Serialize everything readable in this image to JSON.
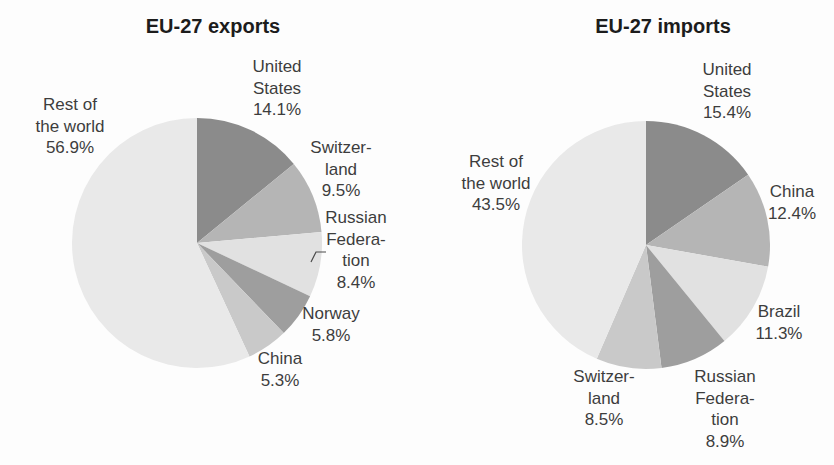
{
  "figure": {
    "background": "#fdfdfd",
    "label_text_color": "#3d3d3d",
    "title_text_color": "#1c1c1c",
    "callout_line_color": "#4a4a4a"
  },
  "chart_data": [
    {
      "type": "pie",
      "id": "eu27-exports",
      "title": "EU-27 exports",
      "unit": "%",
      "direction": "clockwise",
      "start_angle_deg": 0,
      "center_x": 197,
      "center_y": 243,
      "radius": 125,
      "slices": [
        {
          "name": "United States",
          "value": 14.1,
          "color": "#8b8b8b",
          "label_lines": [
            "United",
            "States",
            "14.1%"
          ],
          "label_x": 277,
          "label_y": 59
        },
        {
          "name": "Switzerland",
          "value": 9.5,
          "color": "#b5b5b5",
          "label_lines": [
            "Switzer-",
            "land",
            "9.5%"
          ],
          "label_x": 341,
          "label_y": 140
        },
        {
          "name": "Russian Federation",
          "value": 8.4,
          "color": "#e1e1e1",
          "label_lines": [
            "Russian",
            "Federa-",
            "tion",
            "8.4%"
          ],
          "label_x": 356,
          "label_y": 210,
          "callout": [
            [
              311,
              262
            ],
            [
              316,
              252
            ],
            [
              326,
              252
            ]
          ]
        },
        {
          "name": "Norway",
          "value": 5.8,
          "color": "#9e9e9e",
          "label_lines": [
            "Norway",
            "5.8%"
          ],
          "label_x": 331,
          "label_y": 306
        },
        {
          "name": "China",
          "value": 5.3,
          "color": "#c9c9c9",
          "label_lines": [
            "China",
            "5.3%"
          ],
          "label_x": 280,
          "label_y": 351
        },
        {
          "name": "Rest of the world",
          "value": 56.9,
          "color": "#e9e9e9",
          "label_lines": [
            "Rest of",
            "the world",
            "56.9%"
          ],
          "label_x": 70,
          "label_y": 97
        }
      ]
    },
    {
      "type": "pie",
      "id": "eu27-imports",
      "title": "EU-27 imports",
      "unit": "%",
      "direction": "clockwise",
      "start_angle_deg": 0,
      "center_x": 646,
      "center_y": 245,
      "radius": 124,
      "slices": [
        {
          "name": "United States",
          "value": 15.4,
          "color": "#8b8b8b",
          "label_lines": [
            "United",
            "States",
            "15.4%"
          ],
          "label_x": 727,
          "label_y": 62
        },
        {
          "name": "China",
          "value": 12.4,
          "color": "#b5b5b5",
          "label_lines": [
            "China",
            "12.4%"
          ],
          "label_x": 792,
          "label_y": 184
        },
        {
          "name": "Brazil",
          "value": 11.3,
          "color": "#e1e1e1",
          "label_lines": [
            "Brazil",
            "11.3%"
          ],
          "label_x": 779,
          "label_y": 304
        },
        {
          "name": "Russian Federation",
          "value": 8.9,
          "color": "#9e9e9e",
          "label_lines": [
            "Russian",
            "Federa-",
            "tion",
            "8.9%"
          ],
          "label_x": 725,
          "label_y": 369
        },
        {
          "name": "Switzerland",
          "value": 8.5,
          "color": "#c9c9c9",
          "label_lines": [
            "Switzer-",
            "land",
            "8.5%"
          ],
          "label_x": 604,
          "label_y": 369
        },
        {
          "name": "Rest of the world",
          "value": 43.5,
          "color": "#e9e9e9",
          "label_lines": [
            "Rest of",
            "the world",
            "43.5%"
          ],
          "label_x": 496,
          "label_y": 154
        }
      ]
    }
  ]
}
